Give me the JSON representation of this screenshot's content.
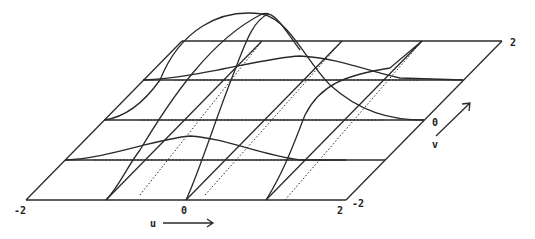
{
  "figure": {
    "u_axis": {
      "label": "u",
      "min_label": "-2",
      "mid_label": "0",
      "max_label": "2"
    },
    "v_axis": {
      "label": "v",
      "min_label": "-2",
      "mid_label": "0",
      "max_label": "2"
    },
    "grid": {
      "rows": 4,
      "cols": 4
    },
    "colors": {
      "line": "#2a2a2a",
      "background": "#ffffff"
    }
  }
}
